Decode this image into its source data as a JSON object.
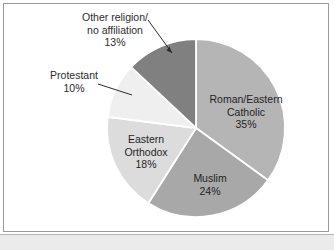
{
  "figure": {
    "background_color": "#ffffff",
    "border_color": "#9a9a9a",
    "bottom_strip_color": "#ebebeb"
  },
  "chart_data": {
    "type": "pie",
    "title": "",
    "subtitle": "",
    "xlabel": "",
    "ylabel": "",
    "grid": false,
    "legend_position": "none",
    "label_format": "name and percent",
    "start_angle_clock_position": "12 o'clock",
    "direction": "clockwise",
    "categories": [
      "Roman/Eastern Catholic",
      "Muslim",
      "Eastern Orthodox",
      "Protestant",
      "Other religion/ no affiliation"
    ],
    "values": [
      35,
      24,
      18,
      10,
      13
    ],
    "value_labels": [
      "35%",
      "24%",
      "18%",
      "10%",
      "13%"
    ],
    "total": 100,
    "slices": [
      {
        "name": "Roman/Eastern Catholic",
        "label_line1": "Roman/Eastern",
        "label_line2": "Catholic",
        "value": 35,
        "value_label": "35%",
        "color": "#b5b5b5",
        "label_placement": "inside"
      },
      {
        "name": "Muslim",
        "label_line1": "Muslim",
        "label_line2": "",
        "value": 24,
        "value_label": "24%",
        "color": "#a8a8a8",
        "label_placement": "inside"
      },
      {
        "name": "Eastern Orthodox",
        "label_line1": "Eastern",
        "label_line2": "Orthodox",
        "value": 18,
        "value_label": "18%",
        "color": "#dcdcdc",
        "label_placement": "inside"
      },
      {
        "name": "Protestant",
        "label_line1": "Protestant",
        "label_line2": "",
        "value": 10,
        "value_label": "10%",
        "color": "#efefef",
        "label_placement": "outside-left"
      },
      {
        "name": "Other religion/ no affiliation",
        "label_line1": "Other religion/",
        "label_line2": "no affiliation",
        "value": 13,
        "value_label": "13%",
        "color": "#808080",
        "label_placement": "outside-top"
      }
    ]
  }
}
